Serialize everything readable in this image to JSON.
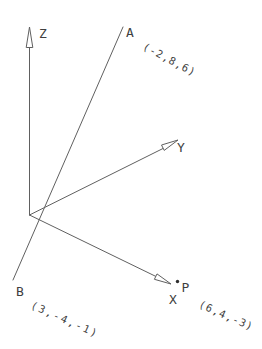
{
  "figure": {
    "background_color": "#ffffff",
    "line_color": "#606060",
    "text_color": "#3f3f3f",
    "axes": {
      "z_label": "Z",
      "y_label": "Y",
      "x_label": "X"
    },
    "points": {
      "a_label": "A",
      "a_coords": "(-2,8,6)",
      "b_label": "B",
      "b_coords": "(3,-4,-1)",
      "p_label": "P",
      "p_coords": "(6,4,-3)"
    }
  }
}
